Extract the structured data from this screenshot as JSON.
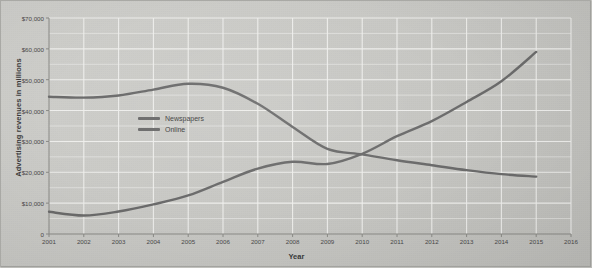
{
  "chart_data": {
    "type": "line",
    "title": "",
    "xlabel": "Year",
    "ylabel": "Advertising revenues in millions",
    "xlim": [
      2001,
      2016
    ],
    "ylim": [
      0,
      70000
    ],
    "grid": true,
    "legend_position": "inside-upper-left",
    "x_tick_labels": [
      "2001",
      "2002",
      "2003",
      "2004",
      "2005",
      "2006",
      "2007",
      "2008",
      "2009",
      "2010",
      "2011",
      "2012",
      "2013",
      "2014",
      "2015",
      "2016"
    ],
    "y_tick_labels": [
      "0",
      "$10,000",
      "$20,000",
      "$30,000",
      "$40,000",
      "$50,000",
      "$60,000",
      "$70,000"
    ],
    "y_tick_values": [
      0,
      10000,
      20000,
      30000,
      40000,
      50000,
      60000,
      70000
    ],
    "y_minor_step": 5000,
    "x": [
      2001,
      2002,
      2003,
      2004,
      2005,
      2006,
      2007,
      2008,
      2009,
      2010,
      2011,
      2012,
      2013,
      2014,
      2015
    ],
    "series": [
      {
        "name": "Newspapers",
        "color": "#6b6b6b",
        "values": [
          44500,
          44200,
          44900,
          46800,
          48700,
          47400,
          42200,
          34700,
          27600,
          25800,
          23900,
          22300,
          20700,
          19400,
          18600
        ]
      },
      {
        "name": "Online",
        "color": "#6b6b6b",
        "values": [
          7200,
          6000,
          7300,
          9600,
          12500,
          16900,
          21200,
          23400,
          22700,
          26000,
          31700,
          36600,
          42800,
          49500,
          59000
        ]
      }
    ],
    "annotations": []
  },
  "legend": {
    "items": [
      {
        "label": "Newspapers",
        "color": "#6b6b6b"
      },
      {
        "label": "Online",
        "color": "#6b6b6b"
      }
    ]
  },
  "colors": {
    "background": "#cbcbc7",
    "plot_background": "#c9c9c5",
    "gridline": "#f0f0ee",
    "axis": "#8a8a86",
    "text": "#3f3f3f",
    "line": "#6b6b6b"
  }
}
